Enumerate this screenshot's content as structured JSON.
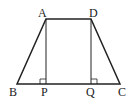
{
  "figure": {
    "type": "trapezoid",
    "labels": {
      "A": "A",
      "B": "B",
      "C": "C",
      "D": "D",
      "P": "P",
      "Q": "Q"
    },
    "points": {
      "A": [
        46,
        19
      ],
      "D": [
        91,
        19
      ],
      "B": [
        17,
        84
      ],
      "C": [
        120,
        84
      ],
      "P": [
        46,
        84
      ],
      "Q": [
        91,
        84
      ]
    },
    "right_angle_marks": [
      "P",
      "Q"
    ],
    "stroke_color": "#222222"
  }
}
